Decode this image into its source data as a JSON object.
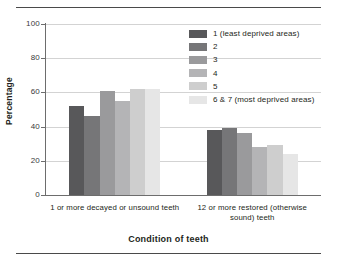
{
  "figure": {
    "has_top_rule": true,
    "has_bottom_rule": true
  },
  "chart_data": {
    "type": "bar",
    "title": "",
    "xlabel": "Condition of teeth",
    "ylabel": "Percentage",
    "ylim": [
      0,
      100
    ],
    "yticks": [
      0,
      20,
      40,
      60,
      80,
      100
    ],
    "ytick_labels": [
      "0",
      "20",
      "40",
      "60",
      "80",
      "100"
    ],
    "grid": true,
    "grid_axis": "y",
    "legend_position": "upper right",
    "categories": [
      "1 or more decayed or unsound teeth",
      "12 or more restored (otherwise sound) teeth"
    ],
    "series": [
      {
        "name": "1 (least deprived areas)",
        "color": "#58585a",
        "values": [
          52,
          38
        ]
      },
      {
        "name": "2",
        "color": "#767678",
        "values": [
          46,
          39
        ]
      },
      {
        "name": "3",
        "color": "#9a9a9c",
        "values": [
          61,
          36
        ]
      },
      {
        "name": "4",
        "color": "#b4b4b6",
        "values": [
          55,
          28
        ]
      },
      {
        "name": "5",
        "color": "#cecece",
        "values": [
          62,
          29
        ]
      },
      {
        "name": "6 & 7 (most deprived areas)",
        "color": "#e6e6e6",
        "values": [
          62,
          24
        ]
      }
    ]
  },
  "legend": {
    "items": [
      {
        "label": "1 (least deprived areas)",
        "color": "#58585a"
      },
      {
        "label": "2",
        "color": "#767678"
      },
      {
        "label": "3",
        "color": "#9a9a9c"
      },
      {
        "label": "4",
        "color": "#b4b4b6"
      },
      {
        "label": "5",
        "color": "#cecece"
      },
      {
        "label": "6 & 7 (most deprived areas)",
        "color": "#e6e6e6"
      }
    ]
  },
  "axes": {
    "y_title": "Percentage",
    "x_title": "Condition of teeth",
    "y_tick_labels": [
      "100",
      "80",
      "60",
      "40",
      "20",
      "0"
    ],
    "x_group_labels": [
      "1 or more decayed or unsound teeth",
      "12 or more restored (otherwise sound) teeth"
    ]
  }
}
